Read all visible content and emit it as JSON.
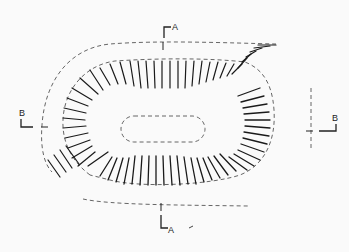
{
  "diagram": {
    "type": "hachure plan of earthwork with section lines",
    "colors": {
      "background": "#fafafa",
      "ink": "#1a1a1a",
      "dash": "#555555"
    },
    "section_markers": [
      {
        "id": "A-top",
        "label": "A",
        "x": 172,
        "y": 30
      },
      {
        "id": "A-bottom",
        "label": "A",
        "x": 172,
        "y": 232
      },
      {
        "id": "B-left",
        "label": "B",
        "x": 21,
        "y": 118
      },
      {
        "id": "B-right",
        "label": "B",
        "x": 333,
        "y": 122
      }
    ]
  }
}
